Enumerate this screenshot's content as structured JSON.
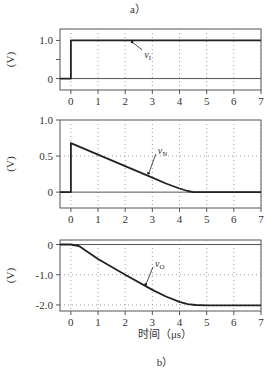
{
  "captions": {
    "top": "a）",
    "bottom": "b）"
  },
  "xaxis": {
    "label": "时间（μs）",
    "ticks": [
      "0",
      "1",
      "2",
      "3",
      "4",
      "5",
      "6",
      "7"
    ],
    "range": [
      -0.4,
      7
    ]
  },
  "colors": {
    "curve": "#222222",
    "grid": "#888888",
    "frame": "#555555"
  },
  "chart_data": [
    {
      "type": "line",
      "title": "",
      "xlabel": "",
      "ylabel": "(V)",
      "ylim": [
        -0.3,
        1.3
      ],
      "yticks": [
        "1.0",
        "0"
      ],
      "grid": true,
      "series": [
        {
          "name": "vI",
          "label_main": "v",
          "label_sub": "I",
          "x": [
            -0.4,
            0,
            0,
            7
          ],
          "values": [
            0,
            0,
            1.0,
            1.0
          ]
        }
      ]
    },
    {
      "type": "line",
      "title": "",
      "xlabel": "",
      "ylabel": "(V)",
      "ylim": [
        -0.22,
        1.0
      ],
      "yticks": [
        "1.0",
        "0.5",
        "0"
      ],
      "grid": true,
      "series": [
        {
          "name": "vN",
          "label_main": "v",
          "label_sub": "N",
          "x": [
            -0.4,
            0,
            0,
            1,
            2,
            3,
            3.5,
            4,
            4.3,
            4.5,
            7
          ],
          "values": [
            0,
            0,
            0.68,
            0.52,
            0.36,
            0.2,
            0.12,
            0.05,
            0.015,
            0,
            0
          ]
        }
      ]
    },
    {
      "type": "line",
      "title": "",
      "xlabel": "时间（μs）",
      "ylabel": "(V)",
      "ylim": [
        -2.2,
        0.15
      ],
      "yticks": [
        "0",
        "-1.0",
        "-2.0"
      ],
      "grid": true,
      "series": [
        {
          "name": "vO",
          "label_main": "v",
          "label_sub": "O",
          "x": [
            -0.4,
            0,
            0.3,
            1,
            2,
            3,
            3.5,
            4,
            4.3,
            4.6,
            5,
            7
          ],
          "values": [
            0,
            0,
            -0.05,
            -0.48,
            -1.0,
            -1.5,
            -1.72,
            -1.9,
            -1.97,
            -2.0,
            -2.01,
            -2.01
          ]
        }
      ]
    }
  ]
}
